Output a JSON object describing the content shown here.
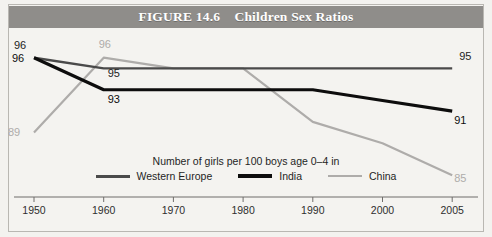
{
  "figure": {
    "banner_title": "FIGURE 14.6    Children Sex Ratios",
    "caption": "Number of girls per 100 boys age 0–4 in"
  },
  "colors": {
    "banner_background": "#8f8d8a",
    "banner_text": "#ffffff",
    "page_background": "#f3f2ef",
    "western_europe": "#4a4a4a",
    "india": "#0d0d0d",
    "china": "#aeacaa",
    "axis": "#6f6d6a"
  },
  "legend": {
    "position": "bottom-center",
    "entries": [
      {
        "label": "Western Europe",
        "color": "#4a4a4a",
        "width": 3
      },
      {
        "label": "India",
        "color": "#0d0d0d",
        "width": 3.4
      },
      {
        "label": "China",
        "color": "#aeacaa",
        "width": 2.6
      }
    ]
  },
  "chart_data": {
    "type": "line",
    "title": "FIGURE 14.6    Children Sex Ratios",
    "subtitle": "Number of girls per 100 boys age 0–4 in",
    "xlabel": "",
    "ylabel": "Number of girls per 100 boys age 0–4",
    "grid": false,
    "legend_position": "bottom-center",
    "x": [
      "1950",
      "1960",
      "1970",
      "1980",
      "1990",
      "2000",
      "2005"
    ],
    "x_spacing": "categorical-even",
    "ylim": [
      84,
      97
    ],
    "series": [
      {
        "name": "Western Europe",
        "color": "#4a4a4a",
        "values": [
          96,
          95,
          95,
          95,
          95,
          95,
          95
        ],
        "endpoint_labels": {
          "start": "96",
          "end": "95"
        }
      },
      {
        "name": "India",
        "color": "#0d0d0d",
        "values": [
          96,
          93,
          93,
          93,
          93,
          92,
          91
        ],
        "endpoint_labels": {
          "start": "96",
          "end": "91"
        }
      },
      {
        "name": "China",
        "color": "#aeacaa",
        "values": [
          89,
          96,
          95,
          95,
          90,
          88,
          85
        ],
        "endpoint_labels": {
          "start": "89",
          "end": "85"
        }
      }
    ],
    "annotations": [
      {
        "text": "96",
        "series": "Western Europe",
        "x": "1950",
        "value": 96,
        "tone": "dark"
      },
      {
        "text": "96",
        "series": "India",
        "x": "1950",
        "value": 96,
        "tone": "black"
      },
      {
        "text": "89",
        "series": "China",
        "x": "1950",
        "value": 89,
        "tone": "light"
      },
      {
        "text": "96",
        "series": "China",
        "x": "1960",
        "value": 96,
        "tone": "light"
      },
      {
        "text": "95",
        "series": "Western Europe",
        "x": "1960",
        "value": 95,
        "tone": "dark"
      },
      {
        "text": "93",
        "series": "India",
        "x": "1960",
        "value": 93,
        "tone": "black"
      },
      {
        "text": "95",
        "series": "Western Europe",
        "x": "2005",
        "value": 95,
        "tone": "dark"
      },
      {
        "text": "91",
        "series": "India",
        "x": "2005",
        "value": 91,
        "tone": "black"
      },
      {
        "text": "85",
        "series": "China",
        "x": "2005",
        "value": 85,
        "tone": "light"
      }
    ],
    "x_tick_labels": [
      "1950",
      "1960",
      "1970",
      "1980",
      "1990",
      "2000",
      "2005"
    ]
  }
}
